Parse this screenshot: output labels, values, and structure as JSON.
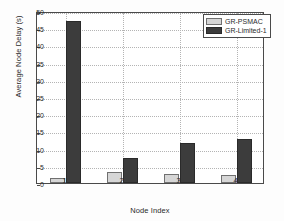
{
  "chart_data": {
    "type": "bar",
    "title": "",
    "xlabel": "Node Index",
    "ylabel": "Average Node Delay (s)",
    "categories": [
      "1",
      "2",
      "3",
      "4"
    ],
    "yticks": [
      "0",
      "5",
      "10",
      "15",
      "20",
      "25",
      "30",
      "35",
      "40",
      "45",
      "50"
    ],
    "ylim": [
      0,
      50
    ],
    "grid": true,
    "legend_position": "top-right",
    "series": [
      {
        "name": "GR-PSMAC",
        "color": "#d6d6d6",
        "values": [
          1.6,
          3.3,
          2.6,
          2.3
        ]
      },
      {
        "name": "GR-Limited-1",
        "color": "#3c3c3c",
        "values": [
          47.2,
          7.2,
          11.5,
          12.9
        ]
      }
    ]
  }
}
